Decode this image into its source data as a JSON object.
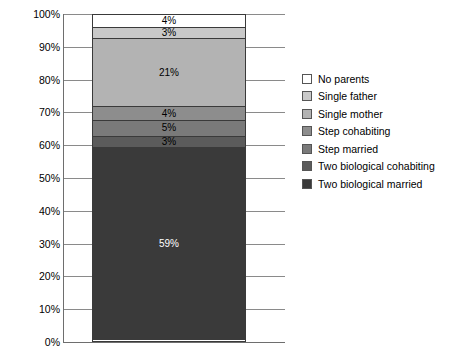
{
  "chart_data": {
    "type": "bar",
    "title": "",
    "subtitle": "",
    "xlabel": "",
    "ylabel": "",
    "ylim": [
      0,
      100
    ],
    "grid": true,
    "legend_position": "right",
    "stacked": true,
    "orientation": "vertical",
    "categories": [
      ""
    ],
    "tick_labels": [
      "100%",
      "90%",
      "80%",
      "70%",
      "60%",
      "50%",
      "40%",
      "30%",
      "20%",
      "10%",
      "0%"
    ],
    "tick_values": [
      100,
      90,
      80,
      70,
      60,
      50,
      40,
      30,
      20,
      10,
      0
    ],
    "series": [
      {
        "name": "No parents",
        "value": 4,
        "label": "4%",
        "color": "#ffffff",
        "text_color": "#000000"
      },
      {
        "name": "Single father",
        "value": 3,
        "label": "3%",
        "color": "#c9c9c9",
        "text_color": "#000000"
      },
      {
        "name": "Single mother",
        "value": 21,
        "label": "21%",
        "color": "#b3b3b3",
        "text_color": "#000000"
      },
      {
        "name": "Step cohabiting",
        "value": 4,
        "label": "4%",
        "color": "#8d8d8d",
        "text_color": "#000000"
      },
      {
        "name": "Step married",
        "value": 5,
        "label": "5%",
        "color": "#7a7a7a",
        "text_color": "#000000"
      },
      {
        "name": "Two biological cohabiting",
        "value": 3,
        "label": "3%",
        "color": "#5b5b5b",
        "text_color": "#000000"
      },
      {
        "name": "Two biological married",
        "value": 59,
        "label": "59%",
        "color": "#3a3a3a",
        "text_color": "#ffffff"
      }
    ]
  },
  "legend": {
    "items": [
      {
        "label": "No parents",
        "color": "#ffffff"
      },
      {
        "label": "Single father",
        "color": "#c9c9c9"
      },
      {
        "label": "Single mother",
        "color": "#b3b3b3"
      },
      {
        "label": "Step cohabiting",
        "color": "#8d8d8d"
      },
      {
        "label": "Step married",
        "color": "#7a7a7a"
      },
      {
        "label": "Two biological cohabiting",
        "color": "#5b5b5b"
      },
      {
        "label": "Two biological married",
        "color": "#3a3a3a"
      }
    ]
  }
}
